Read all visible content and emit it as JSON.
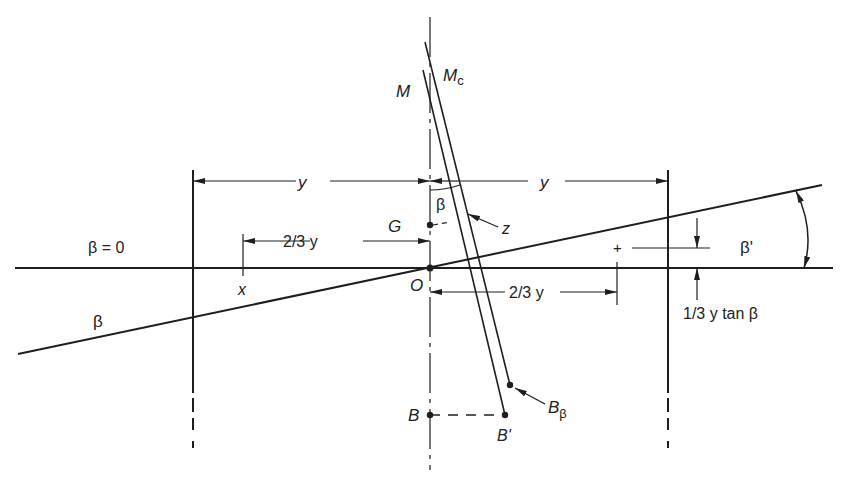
{
  "diagram": {
    "labels": {
      "M": "M",
      "Mc_main": "M",
      "Mc_sub": "c",
      "y_left": "y",
      "y_right": "y",
      "beta_small": "β",
      "G": "G",
      "z": "z",
      "beta_zero": "β = 0",
      "two_thirds_y_upper": "2/3 y",
      "x": "x",
      "O": "O",
      "two_thirds_y_lower": "2/3 y",
      "plus": "+",
      "beta_prime": "β'",
      "one_third_tan": "1/3 y tan β",
      "beta_line": "β",
      "B": "B",
      "B_prime": "B'",
      "B_beta_main": "B",
      "B_beta_sub": "β"
    },
    "colors": {
      "ink": "#1e1e1e",
      "background": "#ffffff"
    }
  }
}
